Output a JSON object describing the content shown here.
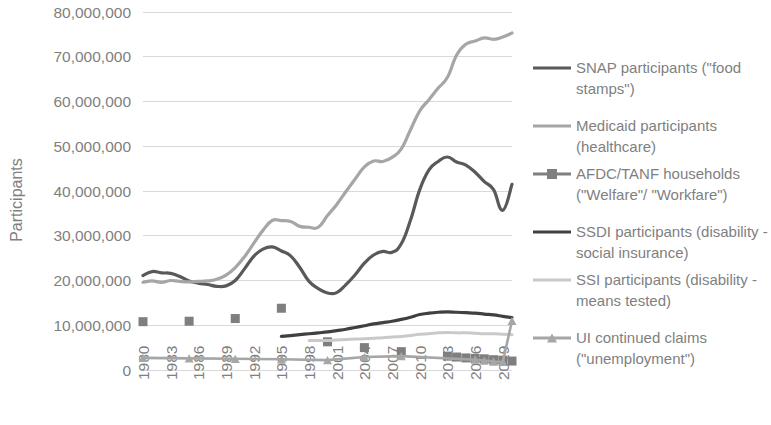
{
  "chart_data": {
    "type": "line",
    "title": "",
    "xlabel": "",
    "ylabel": "Participants",
    "ylim": [
      0,
      80000000
    ],
    "ytick_step": 10000000,
    "ytick_labels": [
      "0",
      "10,000,000",
      "20,000,000",
      "30,000,000",
      "40,000,000",
      "50,000,000",
      "60,000,000",
      "70,000,000",
      "80,000,000"
    ],
    "xlim": [
      1980,
      2020
    ],
    "xtick_labels": [
      "1980",
      "1983",
      "1986",
      "1989",
      "1992",
      "1995",
      "1998",
      "2001",
      "2004",
      "2007",
      "2010",
      "2013",
      "2016",
      "2019"
    ],
    "xtick_values": [
      1980,
      1983,
      1986,
      1989,
      1992,
      1995,
      1998,
      2001,
      2004,
      2007,
      2010,
      2013,
      2016,
      2019
    ],
    "grid": true,
    "legend_position": "right",
    "series": [
      {
        "name": "SNAP participants (\"food stamps\")",
        "legend_label_lines": [
          "SNAP participants (\"food",
          "stamps\")"
        ],
        "color": "#595959",
        "width": 3.2,
        "marker": "none",
        "x": [
          1980,
          1981,
          1982,
          1983,
          1984,
          1985,
          1986,
          1987,
          1988,
          1989,
          1990,
          1991,
          1992,
          1993,
          1994,
          1995,
          1996,
          1997,
          1998,
          1999,
          2000,
          2001,
          2002,
          2003,
          2004,
          2005,
          2006,
          2007,
          2008,
          2009,
          2010,
          2011,
          2012,
          2013,
          2014,
          2015,
          2016,
          2017,
          2018,
          2019,
          2020
        ],
        "values": [
          21100000,
          22000000,
          21700000,
          21600000,
          20900000,
          19900000,
          19400000,
          19100000,
          18700000,
          18800000,
          20000000,
          22600000,
          25400000,
          27000000,
          27500000,
          26600000,
          25500000,
          22900000,
          19800000,
          18200000,
          17200000,
          17300000,
          19100000,
          21300000,
          23900000,
          25700000,
          26500000,
          26300000,
          28200000,
          33500000,
          40300000,
          44700000,
          46600000,
          47600000,
          46500000,
          45800000,
          44200000,
          42100000,
          40300000,
          35700000,
          41500000
        ]
      },
      {
        "name": "Medicaid participants (healthcare)",
        "legend_label_lines": [
          "Medicaid participants",
          "(healthcare)"
        ],
        "color": "#a6a6a6",
        "width": 3.2,
        "marker": "none",
        "x": [
          1980,
          1981,
          1982,
          1983,
          1984,
          1985,
          1986,
          1987,
          1988,
          1989,
          1990,
          1991,
          1992,
          1993,
          1994,
          1995,
          1996,
          1997,
          1998,
          1999,
          2000,
          2001,
          2002,
          2003,
          2004,
          2005,
          2006,
          2007,
          2008,
          2009,
          2010,
          2011,
          2012,
          2013,
          2014,
          2015,
          2016,
          2017,
          2018,
          2019,
          2020
        ],
        "values": [
          19600000,
          19900000,
          19600000,
          20000000,
          19800000,
          19700000,
          19800000,
          19900000,
          20300000,
          21200000,
          22900000,
          25300000,
          28300000,
          31200000,
          33400000,
          33400000,
          33200000,
          32100000,
          31900000,
          31900000,
          34500000,
          37000000,
          39900000,
          42700000,
          45400000,
          46700000,
          46600000,
          47500000,
          49400000,
          53700000,
          57900000,
          60400000,
          63000000,
          65400000,
          70400000,
          72800000,
          73500000,
          74200000,
          73900000,
          74400000,
          75300000
        ]
      },
      {
        "name": "AFDC/TANF households (\"Welfare\"/ \"Workfare\")",
        "legend_label_lines": [
          "AFDC/TANF households",
          "(\"Welfare\"/ \"Workfare\")"
        ],
        "color": "#7f7f7f",
        "width": 0,
        "marker": "square",
        "marker_size": 9,
        "x": [
          1980,
          1985,
          1990,
          1995,
          2000,
          2004,
          2008,
          2013,
          2014,
          2015,
          2016,
          2017,
          2018,
          2019,
          2020
        ],
        "values": [
          10800000,
          10900000,
          11500000,
          13800000,
          6300000,
          5000000,
          4100000,
          3100000,
          2900000,
          2700000,
          2600000,
          2500000,
          2300000,
          2200000,
          2000000
        ]
      },
      {
        "name": "SSDI participants (disability - social insurance)",
        "legend_label_lines": [
          "SSDI participants (disability -",
          "social insurance)"
        ],
        "color": "#404040",
        "width": 3.2,
        "marker": "none",
        "x": [
          1995,
          1996,
          1997,
          1998,
          1999,
          2000,
          2001,
          2002,
          2003,
          2004,
          2005,
          2006,
          2007,
          2008,
          2009,
          2010,
          2011,
          2012,
          2013,
          2014,
          2015,
          2016,
          2017,
          2018,
          2019,
          2020
        ],
        "values": [
          7500000,
          7700000,
          7900000,
          8100000,
          8300000,
          8500000,
          8800000,
          9100000,
          9500000,
          9900000,
          10300000,
          10600000,
          10900000,
          11300000,
          11800000,
          12400000,
          12700000,
          12900000,
          13000000,
          12900000,
          12800000,
          12700000,
          12500000,
          12300000,
          12000000,
          11700000
        ]
      },
      {
        "name": "SSI participants (disability - means tested)",
        "legend_label_lines": [
          "SSI participants (disability -",
          "means tested)"
        ],
        "color": "#c9c9c9",
        "width": 3.0,
        "marker": "none",
        "x": [
          1998,
          1999,
          2000,
          2001,
          2002,
          2003,
          2004,
          2005,
          2006,
          2007,
          2008,
          2009,
          2010,
          2011,
          2012,
          2013,
          2014,
          2015,
          2016,
          2017,
          2018,
          2019,
          2020
        ],
        "values": [
          6600000,
          6600000,
          6600000,
          6700000,
          6800000,
          6900000,
          7000000,
          7100000,
          7200000,
          7400000,
          7500000,
          7700000,
          8000000,
          8100000,
          8300000,
          8400000,
          8300000,
          8300000,
          8200000,
          8100000,
          8100000,
          8000000,
          7900000
        ]
      },
      {
        "name": "UI continued claims (\"unemployment\")",
        "legend_label_lines": [
          "UI continued claims",
          "(\"unemployment\")"
        ],
        "color": "#a6a6a6",
        "width": 2.6,
        "marker": "triangle",
        "marker_size": 9,
        "x": [
          1980,
          1985,
          1990,
          1995,
          2000,
          2004,
          2008,
          2016,
          2017,
          2018,
          2019,
          2020
        ],
        "values": [
          2700000,
          2600000,
          2500000,
          2400000,
          2200000,
          2900000,
          3100000,
          2300000,
          2100000,
          1900000,
          1800000,
          11000000
        ]
      }
    ]
  },
  "axis": {
    "y_title": "Participants"
  },
  "legend": {
    "items": [
      {
        "label": "SNAP participants (\"food stamps\")"
      },
      {
        "label": "Medicaid participants (healthcare)"
      },
      {
        "label": "AFDC/TANF households (\"Welfare\"/ \"Workfare\")"
      },
      {
        "label": "SSDI participants (disability - social insurance)"
      },
      {
        "label": "SSI participants (disability - means tested)"
      },
      {
        "label": "UI continued claims (\"unemployment\")"
      }
    ]
  },
  "colors": {
    "snap": "#595959",
    "medicaid": "#a6a6a6",
    "afdc_tanf": "#7f7f7f",
    "ssdi": "#404040",
    "ssi": "#c9c9c9",
    "ui_claims": "#a6a6a6",
    "gridline": "#d9d9d9",
    "text": "#7f7f7f",
    "background": "#ffffff"
  }
}
